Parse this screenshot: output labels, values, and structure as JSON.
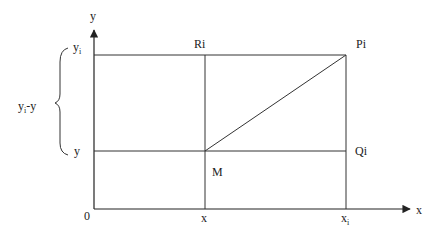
{
  "diagram": {
    "type": "coordinate-geometry",
    "axes": {
      "x_label": "x",
      "y_label": "y",
      "origin_label": "0"
    },
    "points": {
      "M": "M",
      "Pi": "Pi",
      "Qi": "Qi",
      "Ri": "Ri"
    },
    "ticks": {
      "x": "x",
      "xi_base": "x",
      "xi_sub": "i",
      "y": "y",
      "yi_base": "y",
      "yi_sub": "i"
    },
    "brace_label": {
      "base": "y",
      "sub": "i",
      "suffix": "-y"
    }
  }
}
